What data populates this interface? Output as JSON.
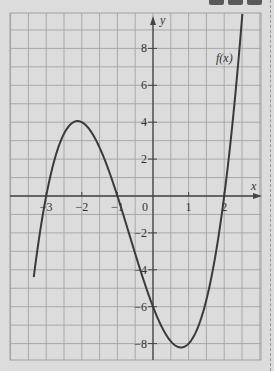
{
  "chart_data": {
    "type": "line",
    "title": "",
    "xlabel": "x",
    "ylabel": "y",
    "xlim": [
      -4,
      3
    ],
    "ylim": [
      -9,
      10
    ],
    "grid": true,
    "x_ticks": [
      -3,
      -2,
      -1,
      0,
      1,
      2
    ],
    "x_tick_labels": [
      "-3",
      "-2",
      "-1",
      "0",
      "1",
      "2"
    ],
    "y_ticks": [
      -8,
      -6,
      -4,
      -2,
      2,
      4,
      6,
      8
    ],
    "y_tick_labels": [
      "-8",
      "-6",
      "-4",
      "-2",
      "2",
      "4",
      "6",
      "8"
    ],
    "series": [
      {
        "name": "f(x)",
        "label": "f(x)",
        "formula": "x^3 + 2x^2 - 5x - 6",
        "x": [
          -3.3,
          -3,
          -2.5,
          -2.12,
          -2,
          -1.5,
          -1,
          -0.5,
          0,
          0.5,
          0.79,
          1,
          1.5,
          2,
          2.5,
          2.85
        ],
        "values": [
          -3.5,
          0,
          3.4,
          4.06,
          4,
          2.6,
          0,
          -3.1,
          -6,
          -7.9,
          -8.2,
          -8,
          -5.6,
          0,
          9.1,
          17
        ]
      }
    ],
    "roots": [
      -3,
      -1,
      2
    ],
    "local_max": [
      -2.12,
      4.06
    ],
    "local_min": [
      0.79,
      -8.21
    ]
  },
  "ui": {
    "toolbar_buttons": [
      "button-1",
      "button-2",
      "button-3"
    ]
  }
}
